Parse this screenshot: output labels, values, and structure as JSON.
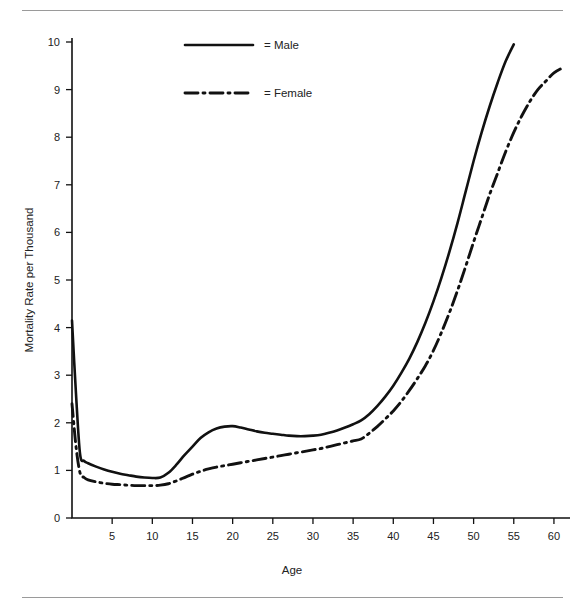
{
  "chart_data": {
    "type": "line",
    "title": "",
    "xlabel": "Age",
    "ylabel": "Mortality Rate per Thousand",
    "xlim": [
      0,
      62
    ],
    "ylim": [
      0,
      10.4
    ],
    "xticks": [
      5,
      10,
      15,
      20,
      25,
      30,
      35,
      40,
      45,
      50,
      55,
      60
    ],
    "yticks": [
      0,
      1,
      2,
      3,
      4,
      5,
      6,
      7,
      8,
      9,
      10
    ],
    "grid": false,
    "legend_position": "top-center",
    "line_color": "#111111",
    "series": [
      {
        "name": "Male",
        "legend_label": "= Male",
        "style": "solid",
        "x": [
          0,
          0.5,
          1,
          1.5,
          2,
          3,
          4,
          5,
          6,
          7,
          8,
          9,
          10,
          11,
          12,
          13,
          14,
          15,
          16,
          17,
          18,
          19,
          20,
          21,
          22,
          23,
          24,
          25,
          26,
          27,
          28,
          29,
          30,
          31,
          32,
          33,
          34,
          35,
          36,
          37,
          38,
          39,
          40,
          41,
          42,
          43,
          44,
          45,
          46,
          47,
          48,
          49,
          50,
          51,
          52,
          53,
          54,
          55
        ],
        "y": [
          4.15,
          2.6,
          1.35,
          1.2,
          1.15,
          1.08,
          1.02,
          0.97,
          0.93,
          0.9,
          0.87,
          0.85,
          0.84,
          0.85,
          0.95,
          1.12,
          1.32,
          1.5,
          1.68,
          1.8,
          1.88,
          1.92,
          1.93,
          1.9,
          1.86,
          1.82,
          1.79,
          1.77,
          1.75,
          1.73,
          1.72,
          1.72,
          1.73,
          1.75,
          1.79,
          1.84,
          1.9,
          1.97,
          2.05,
          2.18,
          2.35,
          2.55,
          2.78,
          3.05,
          3.35,
          3.7,
          4.1,
          4.55,
          5.05,
          5.6,
          6.2,
          6.85,
          7.5,
          8.1,
          8.65,
          9.15,
          9.6,
          9.95
        ]
      },
      {
        "name": "Female",
        "legend_label": "= Female",
        "style": "dash-dot",
        "x": [
          0,
          0.5,
          1,
          1.5,
          2,
          3,
          4,
          5,
          6,
          7,
          8,
          9,
          10,
          11,
          12,
          13,
          14,
          15,
          16,
          17,
          18,
          19,
          20,
          21,
          22,
          23,
          24,
          25,
          26,
          27,
          28,
          29,
          30,
          31,
          32,
          33,
          34,
          35,
          36,
          37,
          38,
          39,
          40,
          41,
          42,
          43,
          44,
          45,
          46,
          47,
          48,
          49,
          50,
          51,
          52,
          53,
          54,
          55,
          56,
          57,
          58,
          59,
          60,
          61
        ],
        "y": [
          2.4,
          1.5,
          0.95,
          0.85,
          0.8,
          0.76,
          0.73,
          0.71,
          0.7,
          0.69,
          0.68,
          0.68,
          0.68,
          0.69,
          0.72,
          0.78,
          0.85,
          0.92,
          0.98,
          1.03,
          1.07,
          1.1,
          1.13,
          1.16,
          1.19,
          1.22,
          1.25,
          1.28,
          1.31,
          1.34,
          1.37,
          1.4,
          1.43,
          1.46,
          1.5,
          1.54,
          1.58,
          1.62,
          1.66,
          1.78,
          1.92,
          2.08,
          2.25,
          2.45,
          2.68,
          2.93,
          3.2,
          3.52,
          3.9,
          4.32,
          4.78,
          5.28,
          5.8,
          6.3,
          6.8,
          7.25,
          7.7,
          8.1,
          8.45,
          8.75,
          9.0,
          9.18,
          9.35,
          9.45
        ]
      }
    ]
  },
  "legend": {
    "male_label": "= Male",
    "female_label": "= Female"
  },
  "axes": {
    "x_title": "Age",
    "y_title": "Mortality Rate per Thousand"
  }
}
